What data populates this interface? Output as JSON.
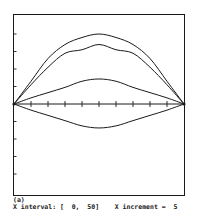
{
  "chart_data": {
    "type": "line",
    "title": "",
    "panel_label": "(a)",
    "xlabel": "",
    "ylabel": "",
    "xlim": [
      0,
      50
    ],
    "ylim": [
      -5,
      5
    ],
    "x_ticks": [
      5,
      10,
      15,
      20,
      25,
      30,
      35,
      40,
      45
    ],
    "y_ticks": [
      -4,
      -3,
      -2,
      -1,
      1,
      2,
      3,
      4
    ],
    "tick_labels_shown": false,
    "grid": false,
    "legend": null,
    "x": [
      0,
      5,
      10,
      15,
      20,
      25,
      30,
      35,
      40,
      45,
      50
    ],
    "series": [
      {
        "name": "curve-1",
        "values": [
          0,
          1.3,
          2.6,
          3.4,
          3.8,
          4.0,
          3.8,
          3.4,
          2.6,
          1.3,
          0
        ]
      },
      {
        "name": "curve-2",
        "values": [
          0,
          1.1,
          2.1,
          2.9,
          3.1,
          3.4,
          3.1,
          2.9,
          2.1,
          1.1,
          0
        ]
      },
      {
        "name": "curve-3",
        "values": [
          0,
          0.35,
          0.65,
          0.95,
          1.3,
          1.43,
          1.3,
          0.95,
          0.65,
          0.35,
          0
        ]
      },
      {
        "name": "curve-4",
        "values": [
          0,
          -0.35,
          -0.65,
          -0.95,
          -1.25,
          -1.37,
          -1.25,
          -0.95,
          -0.65,
          -0.35,
          0
        ]
      }
    ]
  },
  "caption": {
    "label": "(a)",
    "info": "X interval: [  0,  50]    X increment =  5"
  },
  "style": {
    "line_color": "#1a1a1a",
    "frame_color": "#1a1a1a",
    "background": "#ffffff"
  }
}
